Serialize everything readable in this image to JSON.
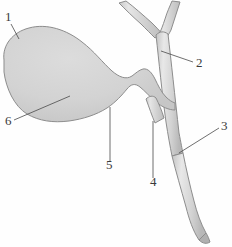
{
  "figure": {
    "background_color": "#fefefe",
    "organ_fill_color": "#d3d3d3",
    "duct_fill_color": "#dcdcdc",
    "outline_color": "#8d8d8d",
    "label_color": "#3a3a3a",
    "leader_color": "#4a4a4a",
    "caption": "",
    "labels": [
      {
        "id": "label-1",
        "text": "1",
        "x": 5,
        "y": 21,
        "leader_from_x": 11,
        "leader_from_y": 24,
        "leader_to_x": 19,
        "leader_to_y": 39,
        "target": "fundus"
      },
      {
        "id": "label-2",
        "text": "2",
        "x": 196,
        "y": 67,
        "leader_from_x": 193,
        "leader_from_y": 62,
        "leader_to_x": 161,
        "leader_to_y": 51,
        "target": "common-hepatic-duct"
      },
      {
        "id": "label-3",
        "text": "3",
        "x": 221,
        "y": 130,
        "leader_from_x": 219,
        "leader_from_y": 128,
        "leader_to_x": 179,
        "leader_to_y": 153,
        "target": "common-bile-duct"
      },
      {
        "id": "label-4",
        "text": "4",
        "x": 150,
        "y": 186,
        "leader_from_x": 153,
        "leader_from_y": 178,
        "leader_to_x": 153,
        "leader_to_y": 121,
        "target": "cystic-duct"
      },
      {
        "id": "label-5",
        "text": "5",
        "x": 106,
        "y": 169,
        "leader_from_x": 110,
        "leader_from_y": 161,
        "leader_to_x": 110,
        "leader_to_y": 107,
        "target": "body"
      },
      {
        "id": "label-6",
        "text": "6",
        "x": 5,
        "y": 125,
        "leader_from_x": 14,
        "leader_from_y": 120,
        "leader_to_x": 70,
        "leader_to_y": 96,
        "target": "neck-infundibulum"
      }
    ],
    "shapes": {
      "gallbladder_path": "M 3.5 62 C 3 46 14 32 30 28 C 48 24 66 30 80 41 C 92 50 100 62 110 70 C 118 77 126 80 133 76 C 137 74 140 71 143 70 C 147 69 150 72 153 77 C 156 82 159 88 163 93 C 166 97 170 100 174 101 L 174 108 C 167 109 160 107 154 103 C 148 99 143 93 138 89 C 133 85 129 85 125 90 C 121 95 116 102 108 107 C 98 113 86 117 73 119 C 58 122 44 121 32 115 C 18 108 8 92 4 76 Z",
      "common_hepatic_left_branch": "M 121 4 L 127 2 L 160 28 L 157 35 Z",
      "common_hepatic_right_branch": "M 173 2 L 180 3 L 170 36 L 163 34 Z",
      "common_duct_upper": "M 157 30 L 171 31 L 182 152 L 173 154 Z",
      "common_bile_duct_lower": "M 173 154 L 182 152 L 195 205 L 205 235 L 197 240 L 186 210 L 174 164 Z",
      "cystic_duct_stub": "M 146 100 L 153 96 L 162 118 L 155 122 Z"
    }
  }
}
